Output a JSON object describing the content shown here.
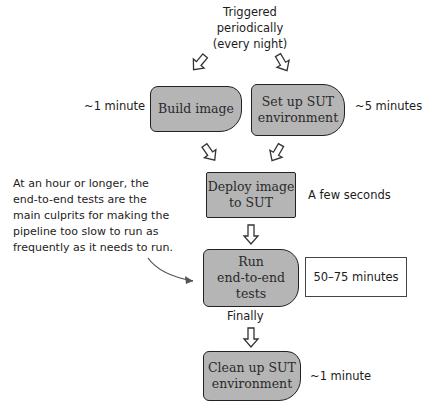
{
  "diagram": {
    "trigger_text": "Triggered\nperiodically\n(every night)",
    "steps": [
      {
        "id": "build-image",
        "label": "Build image",
        "duration": "~1 minute"
      },
      {
        "id": "setup-sut",
        "label": "Set up SUT\nenvironment",
        "duration": "~5 minutes"
      },
      {
        "id": "deploy-image",
        "label": "Deploy image\nto SUT",
        "duration": "A few seconds"
      },
      {
        "id": "run-e2e-tests",
        "label": "Run\nend-to-end\ntests",
        "duration": "50–75 minutes"
      },
      {
        "id": "cleanup-sut",
        "label": "Clean up SUT\nenvironment",
        "duration": "~1 minute"
      }
    ],
    "finally_label": "Finally",
    "annotation": "At an hour or longer, the\nend-to-end tests are the\nmain culprits for making the\npipeline too slow to run as\nfrequently as it needs to run.",
    "colors": {
      "box_fill": "#b5b5b5",
      "box_border": "#222222",
      "text": "#1c1c1c",
      "arrow_outline": "#333333"
    }
  }
}
